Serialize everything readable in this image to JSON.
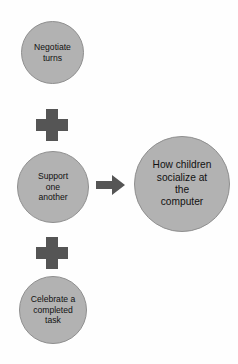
{
  "diagram": {
    "type": "concept-map",
    "orientation": "left-inputs-to-right-outcome",
    "background_color": "#fefefe",
    "node_fill_color": "#b2b2b2",
    "node_border_color": "#8f8f8f",
    "connector_color": "#555555",
    "text_color": "#111111",
    "inputs": [
      {
        "id": "negotiate-turns",
        "label": "Negotiate\nturns",
        "lines": [
          "Negotiate",
          "turns"
        ]
      },
      {
        "id": "support-one-another",
        "label": "Support\none\nanother",
        "lines": [
          "Support",
          "one",
          "another"
        ]
      },
      {
        "id": "celebrate-completed-task",
        "label": "Celebrate a\ncompleted\ntask",
        "lines": [
          "Celebrate a",
          "completed",
          "task"
        ]
      }
    ],
    "operators": [
      {
        "id": "plus-1",
        "symbol": "+",
        "name": "plus-operator"
      },
      {
        "id": "plus-2",
        "symbol": "+",
        "name": "plus-operator"
      }
    ],
    "connector": {
      "id": "arrow-to-result",
      "symbol": "→",
      "name": "right-arrow",
      "direction": "right"
    },
    "result": {
      "id": "how-children-socialize",
      "label": "How children\nsocialize at\nthe\ncomputer",
      "lines": [
        "How children",
        "socialize at",
        "the",
        "computer"
      ]
    }
  }
}
